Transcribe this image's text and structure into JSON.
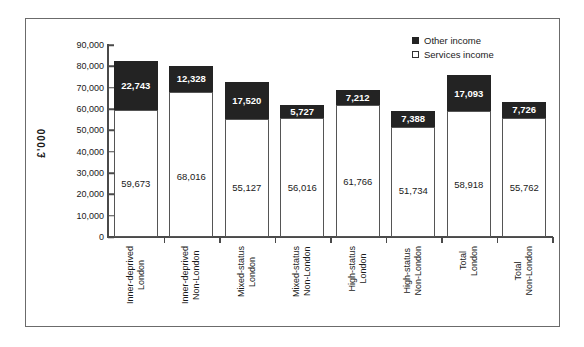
{
  "chart_data": {
    "type": "bar",
    "subtype": "stacked-column",
    "title": "",
    "xlabel": "",
    "ylabel": "£'000",
    "ylim": [
      0,
      90000
    ],
    "ytick_step": 10000,
    "ytick_labels": [
      "90,000",
      "80,000",
      "70,000",
      "60,000",
      "50,000",
      "40,000",
      "30,000",
      "20,000",
      "10,000",
      "0"
    ],
    "grid": false,
    "legend_position": "top-right",
    "categories": [
      "Inner-deprived London",
      "Inner-deprived Non-London",
      "Mixed-status London",
      "Mixed-status Non-London",
      "High-status London",
      "High-status Non-London",
      "Total London",
      "Total Non-London"
    ],
    "category_lines": [
      [
        "Inner-deprived",
        "London"
      ],
      [
        "Inner-deprived",
        "Non-London"
      ],
      [
        "Mixed-status",
        "London"
      ],
      [
        "Mixed-status",
        "Non-London"
      ],
      [
        "High-status",
        "London"
      ],
      [
        "High-status",
        "Non-London"
      ],
      [
        "Total",
        "London"
      ],
      [
        "Total",
        "Non-London"
      ]
    ],
    "series": [
      {
        "name": "Services income",
        "color": "#ffffff",
        "values": [
          59673,
          68016,
          55127,
          56016,
          61766,
          51734,
          58918,
          55762
        ],
        "labels": [
          "59,673",
          "68,016",
          "55,127",
          "56,016",
          "61,766",
          "51,734",
          "58,918",
          "55,762"
        ]
      },
      {
        "name": "Other income",
        "color": "#232323",
        "values": [
          22743,
          12328,
          17520,
          5727,
          7212,
          7388,
          17093,
          7726
        ],
        "labels": [
          "22,743",
          "12,328",
          "17,520",
          "5,727",
          "7,212",
          "7,388",
          "17,093",
          "7,726"
        ]
      }
    ],
    "totals": [
      82416,
      80344,
      72647,
      61743,
      68978,
      59122,
      76011,
      63488
    ]
  },
  "legend": {
    "items": [
      {
        "label": "Other income",
        "marker": "filled-square"
      },
      {
        "label": "Services income",
        "marker": "hollow-square"
      }
    ]
  }
}
